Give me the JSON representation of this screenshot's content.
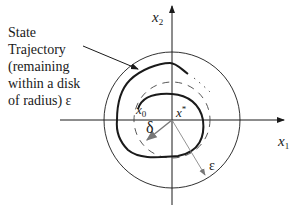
{
  "diagram": {
    "callout": {
      "lines": [
        "State",
        "Trajectory",
        "(remaining",
        "within a disk",
        "of radius) ε"
      ]
    },
    "axes": {
      "x1_label": "x",
      "x1_sub": "1",
      "x2_label": "x",
      "x2_sub": "2"
    },
    "points": {
      "initial_label": "x",
      "initial_sub": "0",
      "equilibrium_label": "x",
      "equilibrium_sup": "*"
    },
    "radii": {
      "inner_label": "δ",
      "outer_label": "ε"
    },
    "colors": {
      "stroke": "#1a1a1a",
      "radius_line": "#8a8a8a",
      "background": "#ffffff"
    }
  }
}
